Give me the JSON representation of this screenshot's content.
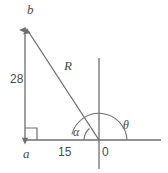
{
  "diagram": {
    "type": "right-triangle-vector-diagram",
    "stroke_color": "#6e6e6e",
    "text_color": "#4a4a4a",
    "background": "#ffffff",
    "labels": {
      "point_b": "b",
      "point_a": "a",
      "origin": "0",
      "vertical_leg": "28",
      "horizontal_leg": "15",
      "hypotenuse": "R",
      "angle_alpha": "α",
      "angle_theta": "θ"
    },
    "geometry": {
      "origin_px": [
        99,
        140
      ],
      "point_a_px": [
        25,
        140
      ],
      "point_b_px": [
        25,
        26
      ],
      "vertical_leg_length": 28,
      "horizontal_leg_length": 15,
      "alpha_arc_radius_px": 15,
      "theta_arc_radius_px": 28,
      "right_angle_marker_at": "a"
    }
  }
}
